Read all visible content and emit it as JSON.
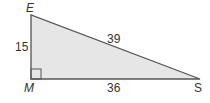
{
  "diagram": {
    "type": "right-triangle",
    "vertices": {
      "E": {
        "label": "E",
        "x": 31,
        "y": 15
      },
      "M": {
        "label": "M",
        "x": 31,
        "y": 79
      },
      "S": {
        "label": "S",
        "x": 200,
        "y": 79
      }
    },
    "right_angle_at": "M",
    "sides": {
      "EM": {
        "label": "15"
      },
      "MS": {
        "label": "36"
      },
      "ES": {
        "label": "39"
      }
    },
    "colors": {
      "fill": "#e6e6e6",
      "stroke": "#555555",
      "text": "#333333"
    }
  }
}
